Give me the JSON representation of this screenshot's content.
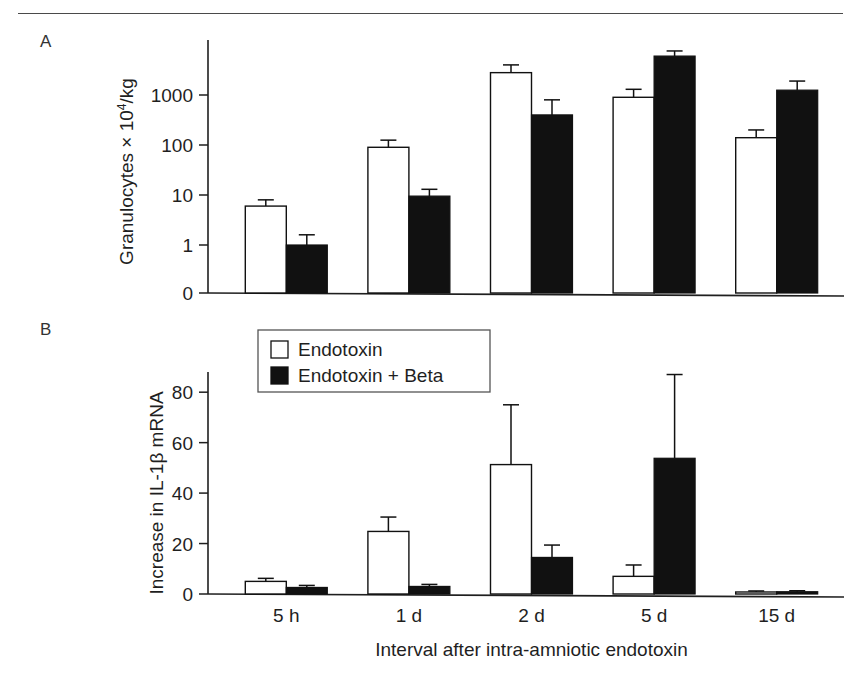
{
  "figure": {
    "panel_a_letter": "A",
    "panel_b_letter": "B"
  },
  "legend": {
    "items": [
      {
        "label": "Endotoxin",
        "swatch": "open-square-icon",
        "color": "#ffffff"
      },
      {
        "label": "Endotoxin + Beta",
        "swatch": "filled-square-icon",
        "color": "#111111"
      }
    ]
  },
  "axes": {
    "shared_xlabel": "Interval after intra-amniotic endotoxin",
    "categories": [
      "5 h",
      "1 d",
      "2 d",
      "5 d",
      "15 d"
    ]
  },
  "chart_data": [
    {
      "id": "panel-a",
      "type": "bar",
      "title": "A",
      "xlabel": "Interval after intra-amniotic endotoxin",
      "ylabel": "Granulocytes × 10⁴/kg",
      "ylabel_parts": {
        "prefix": "Granulocytes × 10",
        "exponent": "4",
        "suffix": "/kg"
      },
      "yscale": "log",
      "yticks": [
        0,
        1,
        10,
        100,
        1000
      ],
      "yticklabels": [
        "0",
        "1",
        "10",
        "100",
        "1000"
      ],
      "ylim": [
        0,
        10000
      ],
      "grid": false,
      "categories": [
        "5 h",
        "1 d",
        "2 d",
        "5 d",
        "15 d"
      ],
      "series": [
        {
          "name": "Endotoxin",
          "fill": "open",
          "values": [
            6,
            90,
            2800,
            900,
            140
          ],
          "err_upper": [
            8,
            125,
            4000,
            1300,
            200
          ],
          "err_lower": [
            6,
            90,
            2800,
            900,
            140
          ]
        },
        {
          "name": "Endotoxin + Beta",
          "fill": "solid",
          "values": [
            1.0,
            9.5,
            400,
            6000,
            1250
          ],
          "err_upper": [
            1.6,
            13,
            800,
            7600,
            1900
          ],
          "err_lower": [
            1.0,
            9.5,
            400,
            6000,
            1250
          ]
        }
      ]
    },
    {
      "id": "panel-b",
      "type": "bar",
      "title": "B",
      "xlabel": "Interval after intra-amniotic endotoxin",
      "ylabel": "Increase in IL-1β mRNA",
      "yscale": "linear",
      "yticks": [
        0,
        20,
        40,
        60,
        80
      ],
      "yticklabels": [
        "0",
        "20",
        "40",
        "60",
        "80"
      ],
      "ylim": [
        0,
        88
      ],
      "grid": false,
      "categories": [
        "5 h",
        "1 d",
        "2 d",
        "5 d",
        "15 d"
      ],
      "series": [
        {
          "name": "Endotoxin",
          "fill": "open",
          "values": [
            5.0,
            24.8,
            51.3,
            7.0,
            0.8
          ],
          "err_upper": [
            6.2,
            30.5,
            75.0,
            11.5,
            1.2
          ],
          "err_lower": [
            5.0,
            24.8,
            51.3,
            7.0,
            0.8
          ]
        },
        {
          "name": "Endotoxin + Beta",
          "fill": "solid",
          "values": [
            2.6,
            3.0,
            14.5,
            53.8,
            0.9
          ],
          "err_upper": [
            3.4,
            3.8,
            19.4,
            87.0,
            1.3
          ],
          "err_lower": [
            2.6,
            3.0,
            14.5,
            53.8,
            0.9
          ]
        }
      ]
    }
  ]
}
